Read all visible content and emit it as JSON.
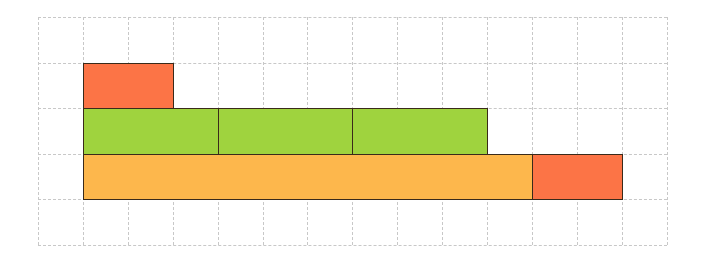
{
  "diagram": {
    "title": "",
    "grid": {
      "columns": 14,
      "rows": 5,
      "cell_width": 44.9,
      "cell_height": 45.5,
      "line_color": "#c8c8c8"
    },
    "colors": {
      "red": "#fc7446",
      "green": "#9fd33e",
      "orange": "#fdb74c",
      "border": "#3a2a1a"
    },
    "blocks": [
      {
        "name": "red-block-top",
        "color": "red",
        "col": 1,
        "row": 1,
        "width": 2,
        "height": 1
      },
      {
        "name": "green-block-1",
        "color": "green",
        "col": 1,
        "row": 2,
        "width": 3,
        "height": 1
      },
      {
        "name": "green-block-2",
        "color": "green",
        "col": 4,
        "row": 2,
        "width": 3,
        "height": 1
      },
      {
        "name": "green-block-3",
        "color": "green",
        "col": 7,
        "row": 2,
        "width": 3,
        "height": 1
      },
      {
        "name": "orange-block",
        "color": "orange",
        "col": 1,
        "row": 3,
        "width": 10,
        "height": 1
      },
      {
        "name": "red-block-right",
        "color": "red",
        "col": 11,
        "row": 3,
        "width": 2,
        "height": 1
      }
    ]
  }
}
